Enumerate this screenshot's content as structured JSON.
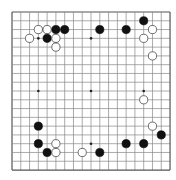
{
  "board": {
    "size": 19,
    "origin_x": 12,
    "origin_y": 12,
    "spacing": 8.78,
    "line_color": "#888888",
    "border_color": "#555555",
    "background": "#ffffff",
    "hoshi": [
      [
        3,
        3
      ],
      [
        9,
        3
      ],
      [
        15,
        3
      ],
      [
        3,
        9
      ],
      [
        9,
        9
      ],
      [
        15,
        9
      ],
      [
        3,
        15
      ],
      [
        9,
        15
      ],
      [
        15,
        15
      ]
    ],
    "stones": [
      {
        "color": "white",
        "x": 3,
        "y": 2
      },
      {
        "color": "white",
        "x": 4,
        "y": 2
      },
      {
        "color": "black",
        "x": 5,
        "y": 2
      },
      {
        "color": "black",
        "x": 6,
        "y": 2
      },
      {
        "color": "white",
        "x": 2,
        "y": 3
      },
      {
        "color": "black",
        "x": 4,
        "y": 3
      },
      {
        "color": "white",
        "x": 5,
        "y": 3
      },
      {
        "color": "white",
        "x": 5,
        "y": 4
      },
      {
        "color": "black",
        "x": 10,
        "y": 2
      },
      {
        "color": "black",
        "x": 13,
        "y": 2
      },
      {
        "color": "black",
        "x": 15,
        "y": 1
      },
      {
        "color": "white",
        "x": 16,
        "y": 2
      },
      {
        "color": "white",
        "x": 15,
        "y": 3
      },
      {
        "color": "white",
        "x": 16,
        "y": 5
      },
      {
        "color": "white",
        "x": 15,
        "y": 10
      },
      {
        "color": "white",
        "x": 16,
        "y": 13
      },
      {
        "color": "black",
        "x": 17,
        "y": 14
      },
      {
        "color": "black",
        "x": 15,
        "y": 15
      },
      {
        "color": "black",
        "x": 13,
        "y": 15
      },
      {
        "color": "black",
        "x": 10,
        "y": 16
      },
      {
        "color": "black",
        "x": 3,
        "y": 13
      },
      {
        "color": "black",
        "x": 3,
        "y": 15
      },
      {
        "color": "white",
        "x": 5,
        "y": 15
      },
      {
        "color": "black",
        "x": 4,
        "y": 16
      },
      {
        "color": "white",
        "x": 5,
        "y": 16
      },
      {
        "color": "white",
        "x": 8,
        "y": 16
      }
    ]
  }
}
